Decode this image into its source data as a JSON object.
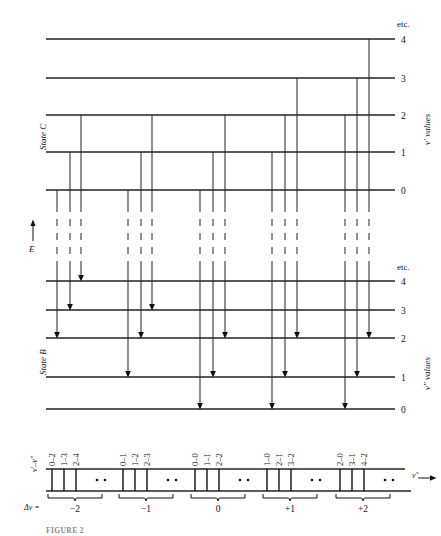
{
  "figure": {
    "caption": "FIGURE 2",
    "axis_energy_label": "E",
    "wavenumber_label": "ν̃",
    "state_upper_label": "State C",
    "state_lower_label": "State B",
    "upper_levels_title": "v′ values",
    "lower_levels_title": "v″ values",
    "etc_label": "etc.",
    "transition_label": "v′–v″",
    "delta_label": "Δv ="
  },
  "upper_state": {
    "label": "State C",
    "side_title": "v′ values",
    "etc": "etc.",
    "levels": [
      {
        "v": "4",
        "y": 39
      },
      {
        "v": "3",
        "y": 78
      },
      {
        "v": "2",
        "y": 115
      },
      {
        "v": "1",
        "y": 152
      },
      {
        "v": "0",
        "y": 190
      }
    ]
  },
  "lower_state": {
    "label": "State B",
    "side_title": "v″ values",
    "etc": "etc.",
    "levels": [
      {
        "v": "4",
        "y": 281
      },
      {
        "v": "3",
        "y": 310
      },
      {
        "v": "2",
        "y": 338
      },
      {
        "v": "1",
        "y": 377
      },
      {
        "v": "0",
        "y": 409
      }
    ]
  },
  "chart_data": {
    "type": "diagram",
    "xlabel": "ν̃",
    "ylabel": "E",
    "grid": false,
    "transitions": [
      {
        "x": 57,
        "vp": "0",
        "vpp": "2",
        "group": "-2"
      },
      {
        "x": 70,
        "vp": "1",
        "vpp": "3",
        "group": "-2"
      },
      {
        "x": 81,
        "vp": "2",
        "vpp": "4",
        "group": "-2"
      },
      {
        "x": 128,
        "vp": "0",
        "vpp": "1",
        "group": "-1"
      },
      {
        "x": 141,
        "vp": "1",
        "vpp": "2",
        "group": "-1"
      },
      {
        "x": 152,
        "vp": "2",
        "vpp": "3",
        "group": "-1"
      },
      {
        "x": 200,
        "vp": "0",
        "vpp": "0",
        "group": "0"
      },
      {
        "x": 213,
        "vp": "1",
        "vpp": "1",
        "group": "0"
      },
      {
        "x": 225,
        "vp": "2",
        "vpp": "2",
        "group": "0"
      },
      {
        "x": 272,
        "vp": "1",
        "vpp": "0",
        "group": "+1"
      },
      {
        "x": 285,
        "vp": "2",
        "vpp": "1",
        "group": "+1"
      },
      {
        "x": 297,
        "vp": "3",
        "vpp": "2",
        "group": "+1"
      },
      {
        "x": 345,
        "vp": "2",
        "vpp": "0",
        "group": "+2"
      },
      {
        "x": 357,
        "vp": "3",
        "vpp": "1",
        "group": "+2"
      },
      {
        "x": 369,
        "vp": "4",
        "vpp": "2",
        "group": "+2"
      }
    ],
    "spectrum_groups": [
      {
        "delta": "−2",
        "lines": [
          "0–2",
          "1–3",
          "2–4"
        ],
        "dots": "··"
      },
      {
        "delta": "−1",
        "lines": [
          "0–1",
          "1–2",
          "2–3"
        ],
        "dots": "··"
      },
      {
        "delta": "0",
        "lines": [
          "0–0",
          "1–1",
          "2–2"
        ],
        "dots": "··"
      },
      {
        "delta": "+1",
        "lines": [
          "1–0",
          "2–1",
          "3–2"
        ],
        "dots": "··"
      },
      {
        "delta": "+2",
        "lines": [
          "2–0",
          "3–1",
          "4–2"
        ],
        "dots": "··"
      }
    ]
  },
  "spectrum": {
    "row_label": "v′–v″",
    "delta_row_label": "Δv =",
    "axis_label": "ν̃",
    "dots": "··"
  }
}
